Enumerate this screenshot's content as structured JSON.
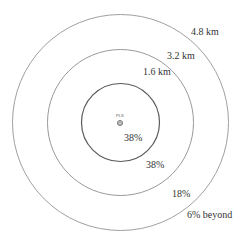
{
  "diagram": {
    "type": "concentric-rings",
    "center": {
      "label": "PLS",
      "symbol": "circle-plus"
    },
    "rings": [
      {
        "radius_label": "1.6 km",
        "share_label": "38%"
      },
      {
        "radius_label": "3.2 km",
        "share_label": "38%"
      },
      {
        "radius_label": "4.8 km",
        "share_label": "18%"
      }
    ],
    "beyond_label": "6% beyond",
    "colors": {
      "inner_ring": "#555555",
      "outer_rings": "#9a9a9a",
      "text": "#333333"
    }
  }
}
